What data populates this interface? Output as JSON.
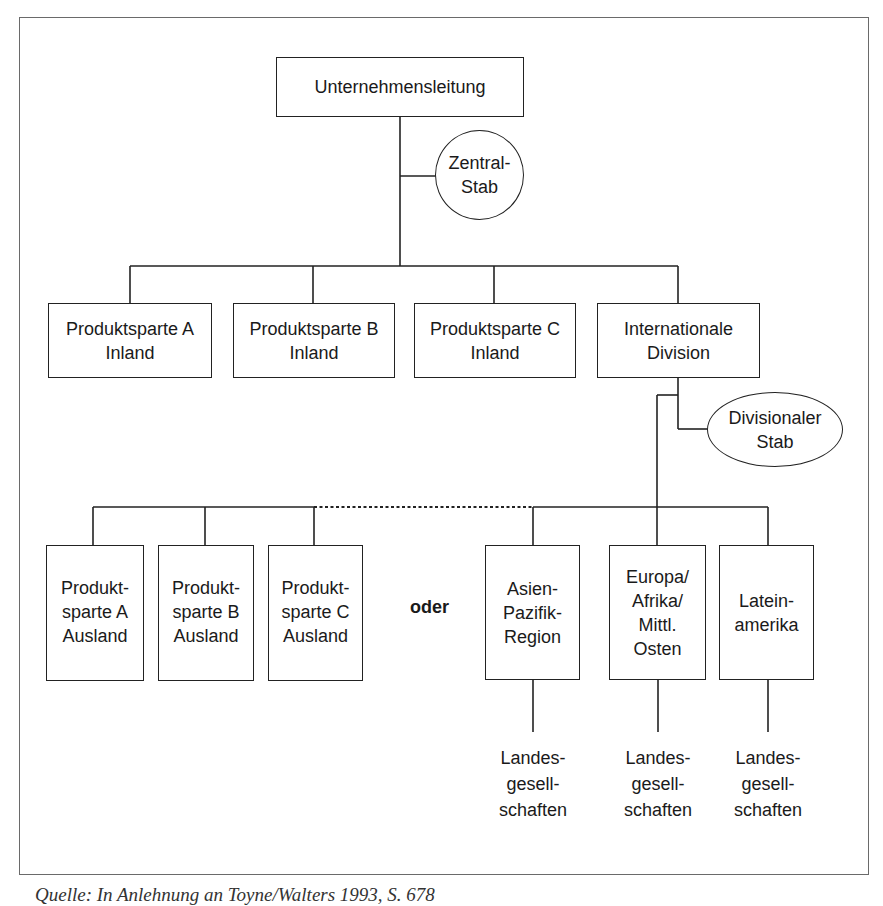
{
  "diagram": {
    "type": "org-chart",
    "root": {
      "id": "unternehmensleitung",
      "lines": [
        "Unternehmensleitung"
      ]
    },
    "root_staff": {
      "id": "zentral-stab",
      "lines": [
        "Zentral-",
        "Stab"
      ]
    },
    "level2": [
      {
        "id": "produktsparte-a-inland",
        "lines": [
          "Produktsparte A",
          "Inland"
        ]
      },
      {
        "id": "produktsparte-b-inland",
        "lines": [
          "Produktsparte B",
          "Inland"
        ]
      },
      {
        "id": "produktsparte-c-inland",
        "lines": [
          "Produktsparte C",
          "Inland"
        ]
      },
      {
        "id": "internationale-division",
        "lines": [
          "Internationale",
          "Division"
        ]
      }
    ],
    "division_staff": {
      "id": "divisionaler-stab",
      "lines": [
        "Divisionaler",
        "Stab"
      ]
    },
    "alternative_separator": "oder",
    "option_product": [
      {
        "id": "produktsparte-a-ausland",
        "lines": [
          "Produkt-",
          "sparte A",
          "Ausland"
        ]
      },
      {
        "id": "produktsparte-b-ausland",
        "lines": [
          "Produkt-",
          "sparte B",
          "Ausland"
        ]
      },
      {
        "id": "produktsparte-c-ausland",
        "lines": [
          "Produkt-",
          "sparte C",
          "Ausland"
        ]
      }
    ],
    "option_region": [
      {
        "id": "asien-pazifik-region",
        "lines": [
          "Asien-",
          "Pazifik-",
          "Region"
        ],
        "child": {
          "lines": [
            "Landes-",
            "gesell-",
            "schaften"
          ]
        }
      },
      {
        "id": "europa-afrika-mittl-osten",
        "lines": [
          "Europa/",
          "Afrika/",
          "Mittl.",
          "Osten"
        ],
        "child": {
          "lines": [
            "Landes-",
            "gesell-",
            "schaften"
          ]
        }
      },
      {
        "id": "lateinamerika",
        "lines": [
          "Latein-",
          "amerika"
        ],
        "child": {
          "lines": [
            "Landes-",
            "gesell-",
            "schaften"
          ]
        }
      }
    ]
  },
  "caption": "Quelle: In Anlehnung an Toyne/Walters 1993, S. 678"
}
